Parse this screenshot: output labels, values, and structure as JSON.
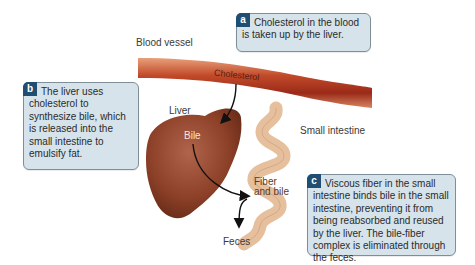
{
  "diagram": {
    "labels": {
      "blood_vessel": "Blood vessel",
      "cholesterol": "Cholesterol",
      "liver": "Liver",
      "bile": "Bile",
      "small_intestine": "Small intestine",
      "fiber_and_bile_line1": "Fiber",
      "fiber_and_bile_line2": "and bile",
      "feces": "Feces"
    },
    "callouts": {
      "a": {
        "badge": "a",
        "text": "Cholesterol in the blood is taken up by the liver."
      },
      "b": {
        "badge": "b",
        "text": "The liver uses cholesterol to synthesize bile, which is released into the small intestine to emulsify fat."
      },
      "c": {
        "badge": "c",
        "text": "Viscous fiber in the small intestine binds bile in the small intestine, preventing it from being reabsorbed and reused by the liver. The bile-fiber complex is eliminated through the feces."
      }
    },
    "colors": {
      "callout_fill": "#d6e3ea",
      "callout_border": "#7f8f99",
      "badge_fill": "#1f4e72",
      "blood_vessel": "#b8422a",
      "liver": "#8e4430",
      "intestine": "#e9c3a2",
      "arrow": "#111111"
    }
  }
}
